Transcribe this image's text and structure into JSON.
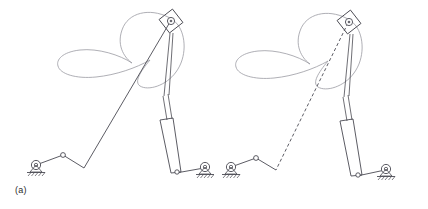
{
  "figure": {
    "panel_count": 2,
    "background_color": "#ffffff"
  },
  "colors": {
    "linkage_stroke": "#4a4a52",
    "coupler_curve_stroke": "#9a9aa2",
    "ground_stroke": "#4a4a52",
    "caption_text": "#2b2b2b",
    "joint_fill": "#ffffff"
  },
  "panels": [
    {
      "id": "a",
      "caption": "(a)",
      "connecting_rod_style": "solid",
      "elements": {
        "coupler_curve_name": "butterfly-coupler-curve",
        "slider_block_name": "top-slider-block",
        "cylinder_name": "vertical-cylinder",
        "ground_pivot_left_name": "ground-pivot-left",
        "ground_pivot_right_name": "ground-pivot-right"
      },
      "geometry": {
        "top_pivot": [
          171,
          20
        ],
        "crank_pivot_ground": [
          36,
          165
        ],
        "crank_joint": [
          63,
          155
        ],
        "rod_lower_joint": [
          84,
          168
        ],
        "slider_base_pivot": [
          176,
          173
        ],
        "ground_pivot_right": [
          204,
          168
        ],
        "cylinder_top": [
          172,
          35
        ],
        "cylinder_bottom": [
          176,
          173
        ],
        "piston_rod_top": [
          162,
          96
        ],
        "sleeve_top": [
          160,
          120
        ],
        "sleeve_bottom": [
          176,
          171
        ]
      }
    },
    {
      "id": "b",
      "caption": "(b)",
      "connecting_rod_style": "dashed",
      "elements": {
        "coupler_curve_name": "butterfly-coupler-curve",
        "slider_block_name": "top-slider-block",
        "cylinder_name": "vertical-cylinder",
        "ground_pivot_left_name": "ground-pivot-left",
        "ground_pivot_right_name": "ground-pivot-right"
      },
      "geometry": {
        "top_pivot": [
          135,
          21
        ],
        "crank_pivot_ground": [
          17,
          167
        ],
        "crank_joint": [
          42,
          158
        ],
        "rod_lower_joint": [
          62,
          170
        ],
        "slider_base_pivot": [
          143,
          176
        ],
        "ground_pivot_right": [
          170,
          170
        ],
        "cylinder_top": [
          138,
          36
        ],
        "cylinder_bottom": [
          143,
          176
        ],
        "piston_rod_top": [
          128,
          97
        ],
        "sleeve_top": [
          126,
          121
        ],
        "sleeve_bottom": [
          143,
          174
        ]
      }
    }
  ]
}
